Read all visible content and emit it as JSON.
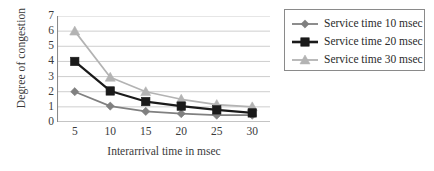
{
  "chart_data": {
    "type": "line",
    "title": "",
    "xlabel": "Interarrival time in msec",
    "ylabel": "Degree of congestion",
    "x": [
      5,
      10,
      15,
      20,
      25,
      30
    ],
    "xtick_labels": [
      "5",
      "10",
      "15",
      "20",
      "25",
      "30"
    ],
    "ytick_labels": [
      "0",
      "1",
      "2",
      "3",
      "4",
      "5",
      "6",
      "7"
    ],
    "xlim": [
      2.5,
      32.5
    ],
    "ylim": [
      0,
      7
    ],
    "grid": "horizontal",
    "legend_position": "right-outside",
    "series": [
      {
        "name": "Service time 10 msec",
        "color": "#808080",
        "marker": "diamond",
        "values": [
          2.0,
          1.05,
          0.7,
          0.55,
          0.45,
          0.45
        ]
      },
      {
        "name": "Service time 20 msec",
        "color": "#1a1a1a",
        "marker": "square",
        "values": [
          4.0,
          2.05,
          1.35,
          1.05,
          0.8,
          0.6
        ]
      },
      {
        "name": "Service time 30 msec",
        "color": "#b3b3b3",
        "marker": "triangle",
        "values": [
          6.0,
          2.95,
          2.0,
          1.5,
          1.15,
          1.0
        ]
      }
    ]
  },
  "legend": {
    "items": [
      {
        "label": "Service time 10 msec"
      },
      {
        "label": "Service time 20 msec"
      },
      {
        "label": "Service time 30 msec"
      }
    ]
  },
  "axes": {
    "y_title": "Degree of congestion",
    "x_title": "Interarrival time in msec"
  },
  "colors": {
    "series_1": "#808080",
    "series_2": "#1a1a1a",
    "series_3": "#b3b3b3",
    "gridline": "#c8c8c8",
    "axis": "#8a8a8a",
    "text": "#3a3a3a",
    "background": "#ffffff"
  }
}
